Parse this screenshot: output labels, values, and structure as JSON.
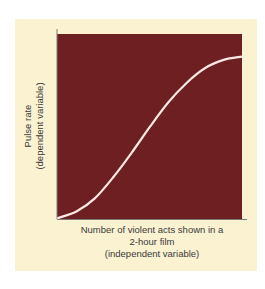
{
  "chart_data": {
    "type": "line",
    "title": "",
    "xlabel": "Number of violent acts shown in a 2-hour film (independent variable)",
    "ylabel": "Pulse rate (dependent variable)",
    "xlabel_lines": [
      "Number of violent acts shown in a",
      "2-hour film",
      "(independent variable)"
    ],
    "ylabel_lines": [
      "Pulse rate",
      "(dependent variable)"
    ],
    "series": [
      {
        "name": "Pulse rate vs violent acts",
        "shape": "sigmoid (S-curve)",
        "x": [
          0,
          0.1,
          0.2,
          0.3,
          0.4,
          0.5,
          0.6,
          0.7,
          0.8,
          0.9,
          1.0
        ],
        "values": [
          0,
          0.04,
          0.12,
          0.25,
          0.4,
          0.56,
          0.71,
          0.83,
          0.92,
          0.97,
          0.99
        ]
      }
    ],
    "x_ticks": [],
    "y_ticks": [],
    "xlim": [
      0,
      1
    ],
    "ylim": [
      0,
      1
    ],
    "grid": false,
    "legend": "none"
  },
  "colors": {
    "background_panel": "#fbf2d2",
    "plot_area": "#6e1f22",
    "curve": "#fbe8e4",
    "axis": "#7a7a7a",
    "text": "#3a3a3a"
  }
}
